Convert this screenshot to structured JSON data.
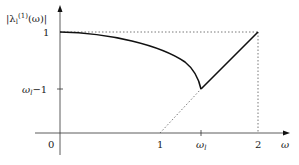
{
  "diagram": {
    "y_axis_label": "|λ",
    "y_axis_label_sub": "l",
    "y_axis_label_sup": "(1)",
    "y_axis_label_tail": "(ω)|",
    "x_axis_label": "ω",
    "origin_label": "0",
    "y_ticks": [
      {
        "label": "1"
      },
      {
        "label": "ω",
        "sub": "l",
        "tail": "−1"
      }
    ],
    "x_ticks": [
      {
        "label": "1"
      },
      {
        "label": "ω",
        "sub": "l"
      },
      {
        "label": "2"
      }
    ],
    "colors": {
      "curve": "#111111",
      "axis": "#333333",
      "dotted": "#555555"
    }
  }
}
